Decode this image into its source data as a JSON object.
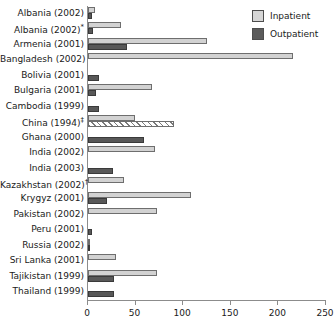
{
  "legend": {
    "position": "top-right",
    "items": [
      {
        "label": "Inpatient",
        "key": "inpatient",
        "color": "#d2d2d2",
        "swatch": "sw-in"
      },
      {
        "label": "Outpatient",
        "key": "outpatient",
        "color": "#585858",
        "swatch": "sw-out"
      }
    ]
  },
  "chart_data": {
    "type": "bar",
    "orientation": "horizontal",
    "title": "",
    "subtitle": "",
    "xlabel": "",
    "ylabel": "",
    "xlim": [
      0,
      250
    ],
    "ylim": null,
    "grid": false,
    "legend_position": "top-right",
    "ticks": [
      "0",
      "50",
      "100",
      "150",
      "200",
      "250"
    ],
    "tick_values": [
      0,
      50,
      100,
      150,
      200,
      250
    ],
    "categories": [
      "Albania (2002)",
      "Albania (2002)*",
      "Armenia (2001)",
      "Bangladesh (2002)",
      "Bolivia (2001)",
      "Bulgaria (2001)",
      "Cambodia (1999)",
      "China (1994)‡",
      "Ghana (2000)",
      "India (2002)",
      "India (2003)",
      "Kazakhstan (2002)†",
      "Krygyz (2001)",
      "Pakistan (2002)",
      "Peru (2001)",
      "Russia (2002)",
      "Sri Lanka (2001)",
      "Tajikistan (1999)",
      "Thailand (1999)"
    ],
    "series": [
      {
        "name": "Inpatient",
        "key": "inpatient",
        "color": "#d2d2d2",
        "values": [
          7,
          35,
          125,
          215,
          0,
          67,
          0,
          49,
          0,
          70,
          0,
          38,
          108,
          72,
          0,
          2,
          29,
          73,
          0
        ]
      },
      {
        "name": "Outpatient",
        "key": "outpatient",
        "color": "#585858",
        "values": [
          4,
          5,
          41,
          0,
          12,
          8,
          12,
          90,
          59,
          0,
          26,
          0,
          20,
          0,
          4,
          1,
          0,
          27,
          27
        ],
        "hatched_indices": [
          7
        ]
      }
    ],
    "notes": [
      "* second Albania 2002 survey",
      "† Kazakhstan footnote",
      "‡ China 1994 footnote"
    ]
  },
  "rows": [
    {
      "label": "Albania (2002)",
      "sup": "",
      "base": "Albania (2002)",
      "inpatient": 7,
      "outpatient": 4,
      "hatch": false
    },
    {
      "label": "Albania (2002)*",
      "sup": "*",
      "base": "Albania (2002)",
      "inpatient": 35,
      "outpatient": 5,
      "hatch": false
    },
    {
      "label": "Armenia (2001)",
      "sup": "",
      "base": "Armenia (2001)",
      "inpatient": 125,
      "outpatient": 41,
      "hatch": false
    },
    {
      "label": "Bangladesh (2002)",
      "sup": "",
      "base": "Bangladesh (2002)",
      "inpatient": 215,
      "outpatient": 0,
      "hatch": false
    },
    {
      "label": "Bolivia (2001)",
      "sup": "",
      "base": "Bolivia (2001)",
      "inpatient": 0,
      "outpatient": 12,
      "hatch": false
    },
    {
      "label": "Bulgaria (2001)",
      "sup": "",
      "base": "Bulgaria (2001)",
      "inpatient": 67,
      "outpatient": 8,
      "hatch": false
    },
    {
      "label": "Cambodia (1999)",
      "sup": "",
      "base": "Cambodia (1999)",
      "inpatient": 0,
      "outpatient": 12,
      "hatch": false
    },
    {
      "label": "China (1994)‡",
      "sup": "‡",
      "base": "China (1994)",
      "inpatient": 49,
      "outpatient": 90,
      "hatch": true
    },
    {
      "label": "Ghana (2000)",
      "sup": "",
      "base": "Ghana (2000)",
      "inpatient": 0,
      "outpatient": 59,
      "hatch": false
    },
    {
      "label": "India (2002)",
      "sup": "",
      "base": "India (2002)",
      "inpatient": 70,
      "outpatient": 0,
      "hatch": false
    },
    {
      "label": "India (2003)",
      "sup": "",
      "base": "India (2003)",
      "inpatient": 0,
      "outpatient": 26,
      "hatch": false
    },
    {
      "label": "Kazakhstan (2002)†",
      "sup": "†",
      "base": "Kazakhstan (2002)",
      "inpatient": 38,
      "outpatient": 0,
      "hatch": false
    },
    {
      "label": "Krygyz (2001)",
      "sup": "",
      "base": "Krygyz (2001)",
      "inpatient": 108,
      "outpatient": 20,
      "hatch": false
    },
    {
      "label": "Pakistan (2002)",
      "sup": "",
      "base": "Pakistan (2002)",
      "inpatient": 72,
      "outpatient": 0,
      "hatch": false
    },
    {
      "label": "Peru (2001)",
      "sup": "",
      "base": "Peru (2001)",
      "inpatient": 0,
      "outpatient": 4,
      "hatch": false
    },
    {
      "label": "Russia (2002)",
      "sup": "",
      "base": "Russia (2002)",
      "inpatient": 2,
      "outpatient": 1,
      "hatch": false
    },
    {
      "label": "Sri Lanka (2001)",
      "sup": "",
      "base": "Sri Lanka (2001)",
      "inpatient": 29,
      "outpatient": 0,
      "hatch": false
    },
    {
      "label": "Tajikistan (1999)",
      "sup": "",
      "base": "Tajikistan (1999)",
      "inpatient": 73,
      "outpatient": 27,
      "hatch": false
    },
    {
      "label": "Thailand (1999)",
      "sup": "",
      "base": "Thailand (1999)",
      "inpatient": 0,
      "outpatient": 27,
      "hatch": false
    }
  ]
}
